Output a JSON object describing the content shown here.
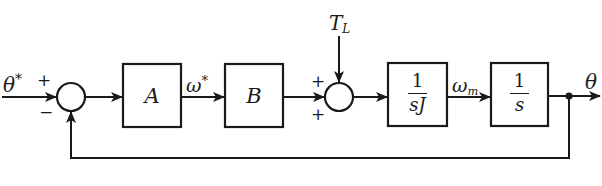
{
  "diagram": {
    "type": "control-block-diagram",
    "input": {
      "symbol": "θ",
      "superscript": "*"
    },
    "junction1": {
      "plus_sign": "+",
      "minus_sign": "−"
    },
    "block_a": {
      "label": "A"
    },
    "signal_omega_ref": {
      "symbol": "ω",
      "superscript": "*"
    },
    "block_b": {
      "label": "B"
    },
    "disturbance": {
      "symbol": "T",
      "subscript": "L"
    },
    "junction2": {
      "top_sign": "+",
      "left_sign": "+",
      "bottom_sign": "+"
    },
    "block_inertia": {
      "numerator": "1",
      "denominator": "sJ"
    },
    "signal_omega_m": {
      "symbol": "ω",
      "subscript": "m"
    },
    "block_integrator": {
      "numerator": "1",
      "denominator": "s"
    },
    "output": {
      "symbol": "θ"
    },
    "colors": {
      "stroke": "#1a1a1a",
      "background": "#ffffff"
    }
  }
}
